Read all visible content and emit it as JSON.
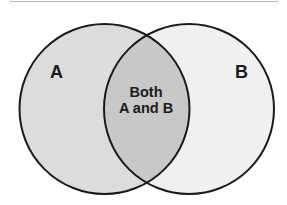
{
  "diagram": {
    "type": "venn",
    "sets": [
      {
        "id": "A",
        "label": "A",
        "fill": "#dcdcdc"
      },
      {
        "id": "B",
        "label": "B",
        "fill": "#f0f0f0"
      }
    ],
    "intersection": {
      "line1": "Both",
      "line2": "A and B",
      "fill": "#c8c8c8"
    },
    "stroke_color": "#1a1a1a"
  }
}
